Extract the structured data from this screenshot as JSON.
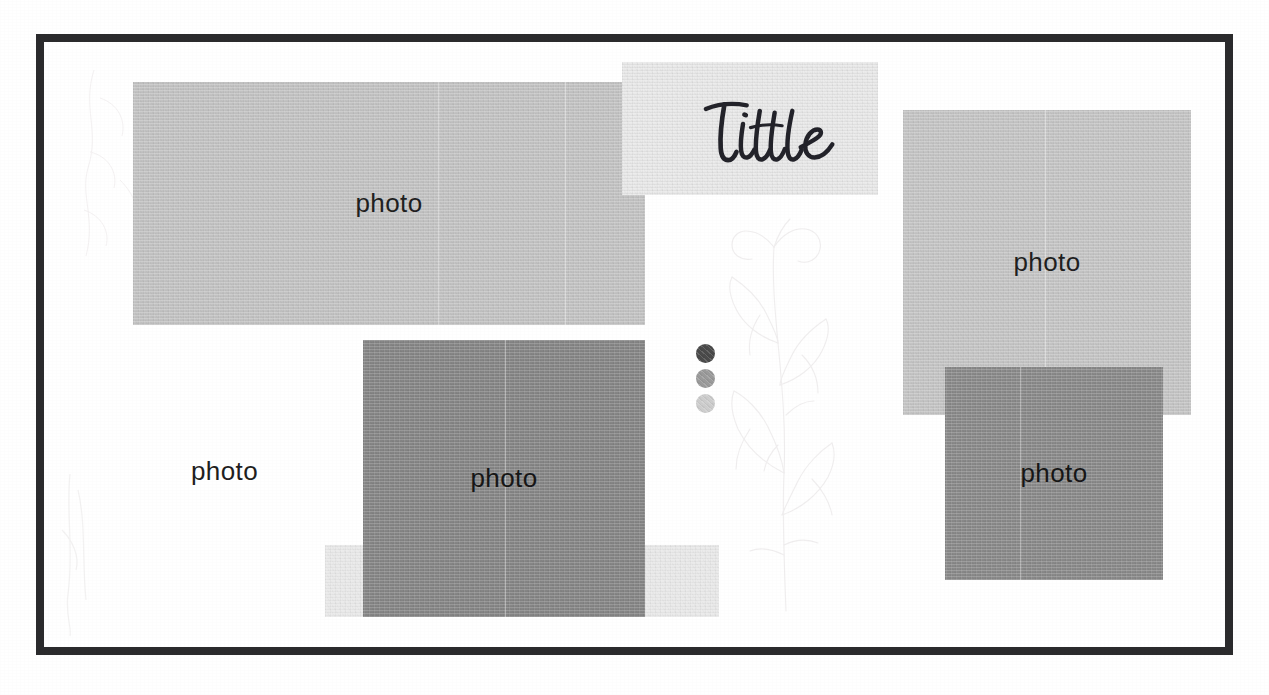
{
  "document": {
    "kind": "scrapbook-layout-template",
    "background_color": "#ffffff",
    "frame_color": "#2b2b2d"
  },
  "title": {
    "text": "Title",
    "style": "handwritten-script",
    "ink_color": "#23232a",
    "band_color": "#e9e9e9"
  },
  "blocks": [
    {
      "id": "photo-main",
      "label": "photo",
      "color": "#c4c4c4",
      "x": 133,
      "y": 82,
      "width": 512,
      "height": 243
    },
    {
      "id": "photo-right-top",
      "label": "photo",
      "color": "#c6c6c6",
      "x": 903,
      "y": 110,
      "width": 288,
      "height": 305
    },
    {
      "id": "photo-center",
      "label": "photo",
      "color": "#868686",
      "x": 363,
      "y": 340,
      "width": 282,
      "height": 277
    },
    {
      "id": "photo-right-bot",
      "label": "photo",
      "color": "#8a8a8a",
      "x": 945,
      "y": 367,
      "width": 218,
      "height": 213
    }
  ],
  "bands": [
    {
      "id": "band-title",
      "color": "#e9e9e9",
      "x": 622,
      "y": 62,
      "width": 256,
      "height": 133
    },
    {
      "id": "band-under",
      "color": "#eaeaea",
      "x": 325,
      "y": 545,
      "width": 394,
      "height": 72
    }
  ],
  "free_caption": {
    "label": "photo",
    "x": 191,
    "y": 456
  },
  "palette": {
    "name": "color-swatches",
    "swatches": [
      {
        "name": "dark-gray",
        "color": "#4a4a4a"
      },
      {
        "name": "mid-gray",
        "color": "#9a9a9a"
      },
      {
        "name": "light-gray",
        "color": "#cdcdcd"
      }
    ]
  },
  "watermark": {
    "name": "botanical-line-drawing",
    "color": "#cfc9cb"
  }
}
